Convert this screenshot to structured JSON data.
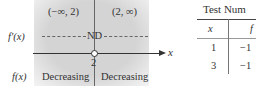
{
  "diagram": {
    "intervals": [
      {
        "label": "(−∞, 2)",
        "behavior": "Decreasing"
      },
      {
        "label": "(2, ∞)",
        "behavior": "Decreasing"
      }
    ],
    "row_labels": {
      "derivative": "f′(x)",
      "function": "f(x)"
    },
    "critical_value": "2",
    "critical_mark": "ND",
    "axis_label": "x"
  },
  "table": {
    "title": "Test Num",
    "columns": [
      "x",
      "f"
    ],
    "rows": [
      [
        "1",
        "−1"
      ],
      [
        "3",
        "−1"
      ]
    ]
  }
}
